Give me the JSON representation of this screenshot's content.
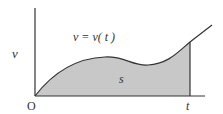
{
  "diagram": {
    "labels": {
      "y_axis": "v",
      "origin": "O",
      "x_tick": "t",
      "curve": "v = v( t )",
      "area": "s"
    },
    "colors": {
      "fill": "#c8c8c8",
      "stroke": "#333333",
      "background": "#ffffff"
    }
  }
}
